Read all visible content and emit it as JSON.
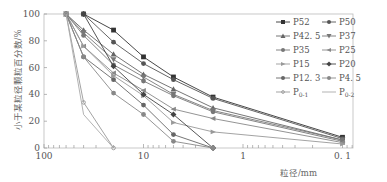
{
  "chart_data": {
    "type": "line",
    "title": "",
    "xlabel": "粒径/mm",
    "ylabel": "小于某粒径颗粒百分数/%",
    "x_scale": "log",
    "x_reversed": true,
    "xlim": [
      100,
      0.08
    ],
    "ylim": [
      0,
      100
    ],
    "x_ticks": [
      100,
      10,
      1,
      0.1
    ],
    "x_tick_labels": [
      "100",
      "10",
      "1",
      "0.1"
    ],
    "y_ticks": [
      0,
      20,
      40,
      60,
      80,
      100
    ],
    "y_tick_labels": [
      "0",
      "20",
      "40",
      "60",
      "80",
      "100"
    ],
    "grid": false,
    "legend_position": "upper right",
    "colors": {
      "axis": "#888888",
      "dark": "#333333",
      "mid": "#666666",
      "light": "#999999"
    },
    "series": [
      {
        "name": "P52",
        "marker": "square",
        "color": "#333333",
        "x": [
          40,
          20,
          10,
          5,
          2,
          0.1
        ],
        "y": [
          100,
          88,
          68,
          53,
          38,
          8
        ]
      },
      {
        "name": "P50",
        "marker": "circle",
        "color": "#555555",
        "x": [
          40,
          20,
          10,
          5,
          2,
          0.1
        ],
        "y": [
          100,
          79,
          63,
          51,
          37,
          7
        ]
      },
      {
        "name": "P42.5",
        "marker": "triangle",
        "color": "#666666",
        "x": [
          60,
          40,
          20,
          10,
          5,
          2,
          0.1
        ],
        "y": [
          100,
          88,
          70,
          55,
          44,
          30,
          6
        ]
      },
      {
        "name": "P37",
        "marker": "tri-down",
        "color": "#777777",
        "x": [
          60,
          40,
          20,
          10,
          5,
          2,
          0.1
        ],
        "y": [
          100,
          86,
          66,
          53,
          40,
          28,
          6
        ]
      },
      {
        "name": "P35",
        "marker": "circle",
        "color": "#777777",
        "x": [
          60,
          40,
          20,
          10,
          5,
          2,
          0.1
        ],
        "y": [
          100,
          84,
          62,
          50,
          39,
          27,
          5
        ]
      },
      {
        "name": "P25",
        "marker": "tri-left",
        "color": "#888888",
        "x": [
          60,
          40,
          20,
          10,
          5,
          2,
          0.1
        ],
        "y": [
          100,
          76,
          56,
          43,
          29,
          22,
          4
        ]
      },
      {
        "name": "P15",
        "marker": "tri-right",
        "color": "#999999",
        "x": [
          60,
          40,
          20,
          10,
          5,
          2,
          0.1
        ],
        "y": [
          100,
          76,
          54,
          39,
          19,
          12,
          3
        ]
      },
      {
        "name": "P20",
        "marker": "diamond",
        "color": "#444444",
        "x": [
          40,
          20,
          10,
          5,
          2
        ],
        "y": [
          100,
          61,
          40,
          25,
          0
        ]
      },
      {
        "name": "P12.3",
        "marker": "circle",
        "color": "#666666",
        "x": [
          60,
          40,
          20,
          10,
          5,
          2
        ],
        "y": [
          100,
          68,
          51,
          32,
          10,
          0
        ]
      },
      {
        "name": "P4.5",
        "marker": "circle",
        "color": "#888888",
        "x": [
          60,
          40,
          20,
          10,
          5,
          2
        ],
        "y": [
          100,
          68,
          41,
          25,
          5,
          0
        ]
      },
      {
        "name": "P0-1",
        "marker": "star",
        "color": "#999999",
        "x": [
          60,
          40,
          20
        ],
        "y": [
          100,
          34,
          0
        ]
      },
      {
        "name": "P0-2",
        "marker": "none",
        "color": "#aaaaaa",
        "x": [
          60,
          40,
          20
        ],
        "y": [
          100,
          25,
          0
        ]
      }
    ]
  },
  "legend": {
    "items": [
      {
        "label": "P52"
      },
      {
        "label": "P50"
      },
      {
        "label": "P42. 5"
      },
      {
        "label": "P37"
      },
      {
        "label": "P35"
      },
      {
        "label": "P25"
      },
      {
        "label": "P15"
      },
      {
        "label": "P20"
      },
      {
        "label": "P12. 3"
      },
      {
        "label": "P4. 5"
      },
      {
        "label": "P0-1"
      },
      {
        "label": "P0-2"
      }
    ]
  },
  "axes": {
    "xlabel": "粒径/mm",
    "ylabel": "小于某粒径颗粒百分数/%",
    "x_tick_labels": [
      "100",
      "10",
      "1",
      "0. 1"
    ],
    "y_tick_labels": [
      "0",
      "20",
      "40",
      "60",
      "80",
      "100"
    ]
  }
}
